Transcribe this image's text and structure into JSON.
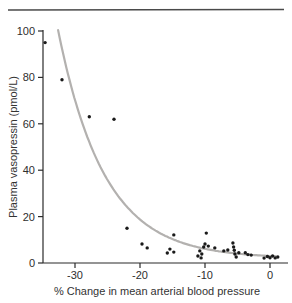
{
  "figure": {
    "top_rule_color": "#4a4a4a"
  },
  "chart_data": {
    "type": "scatter",
    "title": "",
    "xlabel": "% Change in mean arterial blood pressure",
    "ylabel": "Plasma vasopressin (pmol/L)",
    "xlim": [
      -35,
      2.5
    ],
    "ylim": [
      0,
      100
    ],
    "x_ticks": [
      -30,
      -20,
      -10,
      0
    ],
    "y_ticks": [
      0,
      20,
      40,
      60,
      80,
      100
    ],
    "grid": false,
    "legend_position": "none",
    "points": [
      [
        -34.6,
        95
      ],
      [
        -32.0,
        79
      ],
      [
        -27.8,
        63
      ],
      [
        -24.0,
        62
      ],
      [
        -22.0,
        15
      ],
      [
        -19.7,
        8.2
      ],
      [
        -18.9,
        6.5
      ],
      [
        -15.8,
        4.3
      ],
      [
        -15.4,
        6.0
      ],
      [
        -14.8,
        4.7
      ],
      [
        -14.8,
        12.1
      ],
      [
        -11.1,
        3.0
      ],
      [
        -10.8,
        5.2
      ],
      [
        -10.6,
        2.2
      ],
      [
        -10.5,
        3.9
      ],
      [
        -10.2,
        6.9
      ],
      [
        -10.0,
        8.2
      ],
      [
        -9.8,
        12.9
      ],
      [
        -9.5,
        7.3
      ],
      [
        -8.5,
        6.5
      ],
      [
        -7.1,
        5.2
      ],
      [
        -6.5,
        5.6
      ],
      [
        -5.7,
        8.6
      ],
      [
        -5.6,
        6.9
      ],
      [
        -5.5,
        5.5
      ],
      [
        -5.4,
        3.9
      ],
      [
        -5.2,
        2.6
      ],
      [
        -4.8,
        4.4
      ],
      [
        -3.8,
        4.4
      ],
      [
        -3.4,
        3.6
      ],
      [
        -2.9,
        3.4
      ],
      [
        -0.9,
        2.1
      ],
      [
        -0.4,
        2.8
      ],
      [
        0.0,
        2.3
      ],
      [
        0.4,
        3.0
      ],
      [
        0.8,
        2.2
      ],
      [
        1.2,
        2.6
      ]
    ],
    "curve": {
      "model": "exponential_decay",
      "formula": "y = 2 + 97*exp(-0.1404*(x + 32.5))",
      "a": 97,
      "b": 0.1404,
      "c": 2,
      "x0": -32.5,
      "x_start": -32.6,
      "x_end": 0.9
    },
    "colors": {
      "point": "#1a1a1a",
      "curve": "#b3b1af",
      "axis": "#2b2b2b",
      "text": "#2e2e2e"
    }
  }
}
